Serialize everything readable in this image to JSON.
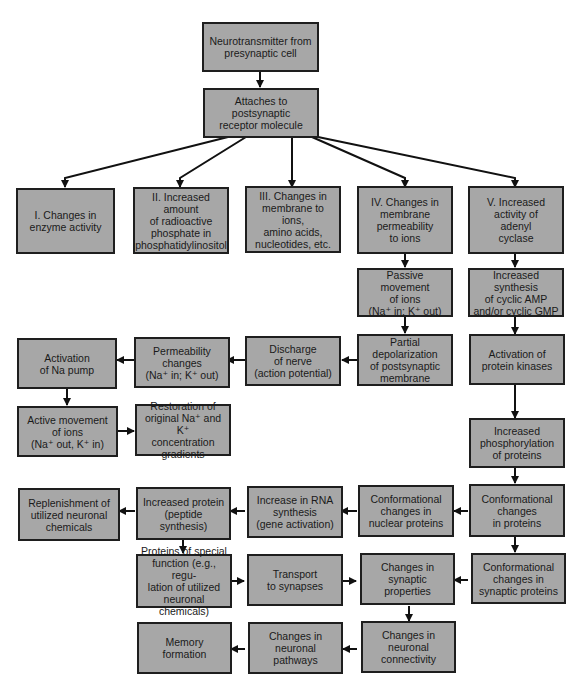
{
  "diagram": {
    "type": "flowchart",
    "box_fill": "#a7a7a7",
    "box_border": "#1e1e1e",
    "nodes": {
      "n1": "Neurotransmitter from\npresynaptic cell",
      "n2": "Attaches to postsynaptic\nreceptor molecule",
      "b1": "I. Changes in\nenzyme activity",
      "b2": "II. Increased amount\nof radioactive\nphosphate in\nphosphatidylinositol",
      "b3": "III. Changes in\nmembrane to ions,\namino acids,\nnucleotides, etc.",
      "b4": "IV. Changes in\nmembrane\npermeability\nto ions",
      "b5": "V. Increased\nactivity of\nadenyl\ncyclase",
      "passive": "Passive movement\nof ions\n(Na⁺ in; K⁺ out)",
      "cyclic": "Increased synthesis\nof cyclic AMP\nand/or cyclic GMP",
      "partial": "Partial\ndepolarization\nof postsynaptic\nmembrane",
      "discharge": "Discharge\nof nerve\n(action potential)",
      "perm": "Permeability\nchanges\n(Na⁺ in; K⁺ out)",
      "napump": "Activation\nof Na pump",
      "kinases": "Activation of\nprotein kinases",
      "active": "Active movement\nof ions\n(Na⁺ out, K⁺ in)",
      "restore": "Restoration of\noriginal Na⁺ and K⁺\nconcentration\ngradients",
      "phospho": "Increased\nphosphorylation\nof proteins",
      "replenish": "Replenishment of\nutilized neuronal\nchemicals",
      "protein": "Increased protein\n(peptide synthesis)",
      "rna": "Increase in RNA\nsynthesis\n(gene activation)",
      "nuclear": "Conformational\nchanges in\nnuclear proteins",
      "conf": "Conformational\nchanges\nin proteins",
      "special": "Proteins of special\nfunction (e.g., regu-\nlation of utilized\nneuronal chemicals)",
      "transport": "Transport\nto synapses",
      "synprop": "Changes in\nsynaptic properties",
      "synprot": "Conformational\nchanges in\nsynaptic proteins",
      "memory": "Memory\nformation",
      "pathways": "Changes in\nneuronal\npathways",
      "connect": "Changes in\nneuronal\nconnectivity"
    },
    "edges": [
      [
        "n1",
        "n2"
      ],
      [
        "n2",
        "b1"
      ],
      [
        "n2",
        "b2"
      ],
      [
        "n2",
        "b3"
      ],
      [
        "n2",
        "b4"
      ],
      [
        "n2",
        "b5"
      ],
      [
        "b4",
        "passive"
      ],
      [
        "b5",
        "cyclic"
      ],
      [
        "passive",
        "partial"
      ],
      [
        "cyclic",
        "kinases"
      ],
      [
        "partial",
        "discharge"
      ],
      [
        "discharge",
        "perm"
      ],
      [
        "perm",
        "napump"
      ],
      [
        "napump",
        "active"
      ],
      [
        "active",
        "restore"
      ],
      [
        "kinases",
        "phospho"
      ],
      [
        "phospho",
        "conf"
      ],
      [
        "conf",
        "nuclear"
      ],
      [
        "nuclear",
        "rna"
      ],
      [
        "rna",
        "protein"
      ],
      [
        "protein",
        "replenish"
      ],
      [
        "protein",
        "special"
      ],
      [
        "conf",
        "synprot"
      ],
      [
        "special",
        "transport"
      ],
      [
        "transport",
        "synprop"
      ],
      [
        "synprot",
        "synprop"
      ],
      [
        "synprop",
        "connect"
      ],
      [
        "connect",
        "pathways"
      ],
      [
        "pathways",
        "memory"
      ]
    ]
  }
}
